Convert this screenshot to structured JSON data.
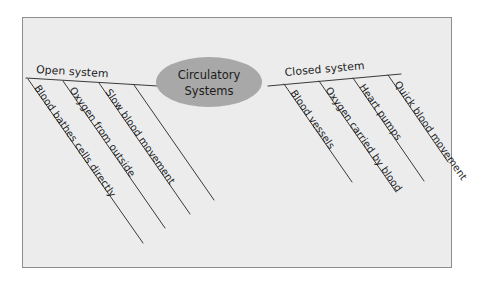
{
  "diagram": {
    "title": "Circulatory Systems",
    "style": "hand-drawn fishbone / tree concept map",
    "canvas_bg": "#ececec",
    "frame_border": "#8d8d8d",
    "node_fill": "#a8a8a8",
    "ink_color": "#1c1c1c",
    "center_node": {
      "line1": "Circulatory",
      "line2": "Systems"
    },
    "branches": [
      {
        "side": "left",
        "label": "Open system",
        "children": [
          "Blood bathes cells directly",
          "Oxygen from outside",
          "Slow blood movement"
        ]
      },
      {
        "side": "right",
        "label": "Closed system",
        "children": [
          "Blood vessels",
          "Oxygen carried by blood",
          "Heart pumps",
          "Quick blood movement"
        ]
      }
    ]
  }
}
